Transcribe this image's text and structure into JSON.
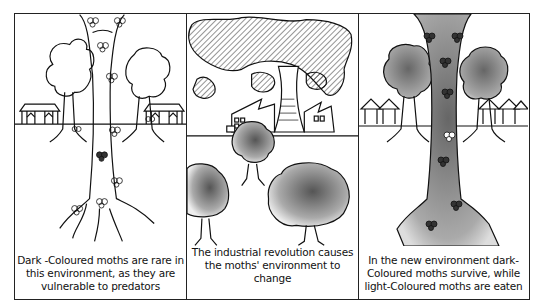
{
  "figure": {
    "panels": [
      {
        "id": "before",
        "scene": "light-bark tree with light-coloured moths, houses in background",
        "caption": "Dark -Coloured moths are rare in this environment, as they are vulnerable to predators",
        "caption_lines": [
          "Dark -Coloured moths are rare in",
          "this environment, as they are",
          "vulnerable to predators"
        ]
      },
      {
        "id": "industrial",
        "scene": "factories with cooling tower emitting smoke, soot-darkened trees",
        "caption": "The industrial revolution causes the moths' environment to change",
        "caption_lines": [
          "The industrial revolution causes",
          "the moths' environment to change"
        ]
      },
      {
        "id": "after",
        "scene": "soot-darkened tree with dark-coloured moths, houses in background",
        "caption": "In the new environment dark-Coloured moths survive, while light-Coloured moths are eaten",
        "caption_lines": [
          "In the new environment dark-",
          "Coloured moths survive, while",
          "light-Coloured moths are eaten"
        ]
      }
    ]
  },
  "colors": {
    "ink": "#111111",
    "paper": "#ffffff",
    "soot": "#8a8a8a"
  }
}
